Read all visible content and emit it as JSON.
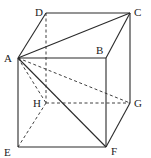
{
  "diagram": {
    "type": "cube",
    "stroke_color": "#2a2a2a",
    "vertices": {
      "A": {
        "x": 18,
        "y": 58,
        "label": "A",
        "lx": 4,
        "ly": 62
      },
      "B": {
        "x": 106,
        "y": 58,
        "label": "B",
        "lx": 96,
        "ly": 54
      },
      "C": {
        "x": 130,
        "y": 13,
        "label": "C",
        "lx": 134,
        "ly": 16
      },
      "D": {
        "x": 46,
        "y": 13,
        "label": "D",
        "lx": 35,
        "ly": 16
      },
      "E": {
        "x": 18,
        "y": 147,
        "label": "E",
        "lx": 4,
        "ly": 156
      },
      "F": {
        "x": 106,
        "y": 147,
        "label": "F",
        "lx": 111,
        "ly": 155
      },
      "G": {
        "x": 130,
        "y": 103,
        "label": "G",
        "lx": 134,
        "ly": 107
      },
      "H": {
        "x": 46,
        "y": 103,
        "label": "H",
        "lx": 33,
        "ly": 107
      }
    },
    "solid_edges": [
      [
        "A",
        "B"
      ],
      [
        "B",
        "C"
      ],
      [
        "C",
        "D"
      ],
      [
        "D",
        "A"
      ],
      [
        "A",
        "E"
      ],
      [
        "E",
        "F"
      ],
      [
        "F",
        "B"
      ],
      [
        "F",
        "G"
      ],
      [
        "G",
        "C"
      ],
      [
        "A",
        "C"
      ],
      [
        "A",
        "F"
      ]
    ],
    "dashed_edges": [
      [
        "D",
        "H"
      ],
      [
        "H",
        "E"
      ],
      [
        "H",
        "G"
      ],
      [
        "A",
        "H"
      ],
      [
        "A",
        "G"
      ]
    ]
  }
}
